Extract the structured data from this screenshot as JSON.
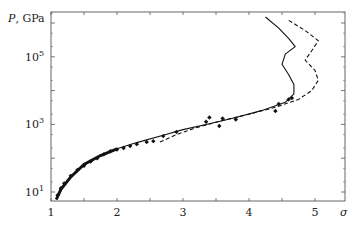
{
  "chart_data": {
    "type": "line",
    "title": "",
    "xlabel": "σ",
    "ylabel": "P, GPa",
    "xlim": [
      1,
      5.45
    ],
    "ylim_log10": [
      0.7,
      6.3
    ],
    "yscale": "log",
    "grid": false,
    "legend": null,
    "x_ticks": [
      1,
      2,
      3,
      4,
      5
    ],
    "y_ticks": [
      {
        "value": 10,
        "label": "10",
        "exp": "1"
      },
      {
        "value": 1000,
        "label": "10",
        "exp": "3"
      },
      {
        "value": 100000,
        "label": "10",
        "exp": "5"
      }
    ],
    "series": [
      {
        "name": "theory (solid)",
        "style": "solid",
        "points": [
          [
            1.08,
            6
          ],
          [
            1.15,
            12
          ],
          [
            1.3,
            28
          ],
          [
            1.5,
            65
          ],
          [
            1.75,
            120
          ],
          [
            2.0,
            190
          ],
          [
            2.3,
            290
          ],
          [
            2.7,
            480
          ],
          [
            3.0,
            700
          ],
          [
            3.4,
            1050
          ],
          [
            3.8,
            1600
          ],
          [
            4.2,
            2600
          ],
          [
            4.55,
            4500
          ],
          [
            4.68,
            8000
          ],
          [
            4.68,
            15000
          ],
          [
            4.6,
            30000
          ],
          [
            4.5,
            60000
          ],
          [
            4.55,
            120000
          ],
          [
            4.7,
            200000
          ],
          [
            4.6,
            350000
          ],
          [
            4.45,
            700000
          ],
          [
            4.25,
            1500000
          ]
        ]
      },
      {
        "name": "theory (dashed)",
        "style": "dashed",
        "points": [
          [
            2.65,
            300
          ],
          [
            2.9,
            500
          ],
          [
            3.2,
            800
          ],
          [
            3.6,
            1300
          ],
          [
            4.0,
            2000
          ],
          [
            4.4,
            3200
          ],
          [
            4.75,
            5500
          ],
          [
            4.95,
            10000
          ],
          [
            5.05,
            20000
          ],
          [
            5.0,
            40000
          ],
          [
            4.85,
            80000
          ],
          [
            4.95,
            150000
          ],
          [
            5.05,
            300000
          ],
          [
            4.85,
            600000
          ],
          [
            4.6,
            1200000
          ]
        ]
      },
      {
        "name": "experiment",
        "style": "markers",
        "points": [
          [
            1.1,
            8
          ],
          [
            1.15,
            13
          ],
          [
            1.2,
            18
          ],
          [
            1.3,
            30
          ],
          [
            1.4,
            45
          ],
          [
            1.5,
            60
          ],
          [
            1.6,
            80
          ],
          [
            1.7,
            100
          ],
          [
            1.8,
            130
          ],
          [
            1.9,
            160
          ],
          [
            2.0,
            180
          ],
          [
            2.1,
            200
          ],
          [
            2.2,
            230
          ],
          [
            2.3,
            260
          ],
          [
            2.45,
            300
          ],
          [
            2.55,
            320
          ],
          [
            2.7,
            450
          ],
          [
            2.9,
            600
          ],
          [
            3.35,
            1200
          ],
          [
            3.55,
            900
          ],
          [
            3.4,
            1600
          ],
          [
            3.6,
            1500
          ],
          [
            3.8,
            1400
          ],
          [
            4.4,
            2500
          ],
          [
            4.45,
            4000
          ],
          [
            4.6,
            5500
          ],
          [
            4.65,
            6000
          ]
        ]
      }
    ]
  }
}
